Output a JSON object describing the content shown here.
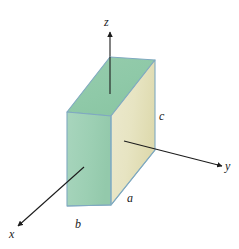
{
  "figure": {
    "background_color": "#ffffff",
    "axes": {
      "z": {
        "label": "z",
        "direction": "up"
      },
      "y": {
        "label": "y",
        "direction": "right"
      },
      "x": {
        "label": "x",
        "direction": "lower-left"
      }
    },
    "dimensions": {
      "a": {
        "label": "a",
        "edge": "front-bottom-horizontal",
        "description": "width of slab along y"
      },
      "b": {
        "label": "b",
        "edge": "bottom-left-depth",
        "description": "thickness of slab along x"
      },
      "c": {
        "label": "c",
        "edge": "right-vertical",
        "description": "height of slab along z"
      }
    },
    "solid": {
      "shape": "rectangular-slab",
      "faces": [
        {
          "name": "front-face",
          "color": "#e7e4c2"
        },
        {
          "name": "left-side-face",
          "color": "#9ccfb3"
        },
        {
          "name": "top-face",
          "color": "#8fc9a8"
        }
      ],
      "edge_color": "#7fa9c0"
    },
    "leader_lines": [
      {
        "name": "z-axis-leader",
        "from": "z-arrow",
        "to": "top-face"
      },
      {
        "name": "y-axis-leader",
        "from": "front-face",
        "to": "y-arrow"
      },
      {
        "name": "x-axis-leader",
        "from": "left-side-face",
        "to": "x-arrow"
      }
    ],
    "colors": {
      "axis_line": "#1c1c1c",
      "front_face": "#e7e4c2",
      "side_face": "#9ccfb3",
      "top_face": "#8fc9a8",
      "edge_stroke": "#7fa9c0",
      "label_text": "#1a1a1a"
    }
  }
}
